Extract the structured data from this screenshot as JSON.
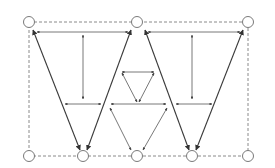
{
  "diagram": {
    "top_nodes": [
      "node-top-left",
      "node-top-center",
      "node-top-right"
    ],
    "bottom_nodes": [
      "node-bottom-1",
      "node-bottom-2",
      "node-bottom-3",
      "node-bottom-4",
      "node-bottom-5"
    ],
    "frame_style": "dashed",
    "colors": {
      "background": "#ffffff",
      "frame": "#8a8a8a",
      "node_stroke": "#7a7a7a",
      "edge_heavy": "#3a3a3a",
      "edge_light": "#555555"
    }
  }
}
